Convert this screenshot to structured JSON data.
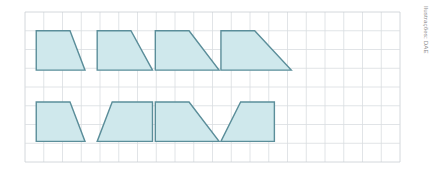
{
  "figure": {
    "credit": "Ilustrações: DAE",
    "canvas": {
      "width": 435,
      "height": 173,
      "background": "#ffffff"
    },
    "grid": {
      "origin_x": 25,
      "origin_y": 12,
      "cell": 18.75,
      "cols": 20,
      "rows": 8,
      "line_color": "#d9dde1",
      "border_color": "#c9ced3",
      "line_width": 0.8,
      "show": true
    },
    "shape_style": {
      "fill": "#cfe8ec",
      "stroke": "#5b8e9a",
      "stroke_width": 1.4,
      "fill_opacity": 1
    },
    "shapes": [
      {
        "name": "trapezoid-1",
        "row": "top",
        "index": 1,
        "points_cells": [
          [
            0.6,
            1.0
          ],
          [
            2.4,
            1.0
          ],
          [
            3.2,
            3.1
          ],
          [
            0.6,
            3.1
          ]
        ]
      },
      {
        "name": "trapezoid-2",
        "row": "top",
        "index": 2,
        "points_cells": [
          [
            3.85,
            1.0
          ],
          [
            5.65,
            1.0
          ],
          [
            6.8,
            3.1
          ],
          [
            3.85,
            3.1
          ]
        ]
      },
      {
        "name": "trapezoid-3",
        "row": "top",
        "index": 3,
        "points_cells": [
          [
            6.95,
            1.0
          ],
          [
            8.75,
            1.0
          ],
          [
            10.35,
            3.1
          ],
          [
            6.95,
            3.1
          ]
        ]
      },
      {
        "name": "trapezoid-4",
        "row": "top",
        "index": 4,
        "points_cells": [
          [
            10.45,
            1.0
          ],
          [
            12.25,
            1.0
          ],
          [
            14.2,
            3.1
          ],
          [
            10.45,
            3.1
          ]
        ]
      },
      {
        "name": "trapezoid-5",
        "row": "bottom",
        "index": 5,
        "points_cells": [
          [
            0.6,
            4.8
          ],
          [
            2.4,
            4.8
          ],
          [
            3.2,
            6.9
          ],
          [
            0.6,
            6.9
          ]
        ]
      },
      {
        "name": "trapezoid-6",
        "row": "bottom",
        "index": 6,
        "points_cells": [
          [
            4.65,
            4.8
          ],
          [
            6.8,
            4.8
          ],
          [
            6.8,
            6.9
          ],
          [
            3.85,
            6.9
          ]
        ]
      },
      {
        "name": "trapezoid-7",
        "row": "bottom",
        "index": 7,
        "points_cells": [
          [
            6.95,
            4.8
          ],
          [
            8.75,
            4.8
          ],
          [
            10.35,
            6.9
          ],
          [
            6.95,
            6.9
          ]
        ]
      },
      {
        "name": "trapezoid-8",
        "row": "bottom",
        "index": 8,
        "points_cells": [
          [
            11.5,
            4.8
          ],
          [
            13.3,
            4.8
          ],
          [
            13.3,
            6.9
          ],
          [
            10.45,
            6.9
          ]
        ]
      }
    ]
  }
}
